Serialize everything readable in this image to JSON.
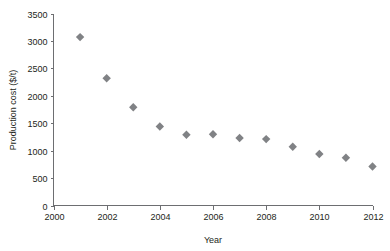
{
  "chart_data": {
    "type": "scatter",
    "title": "",
    "xlabel": "Year",
    "ylabel": "Production cost ($/t)",
    "xlim": [
      2000,
      2012
    ],
    "ylim": [
      0,
      3500
    ],
    "xticks": [
      2000,
      2002,
      2004,
      2006,
      2008,
      2010,
      2012
    ],
    "xticklabels": [
      "2000",
      "2002",
      "2004",
      "2006",
      "2008",
      "2010",
      "2012"
    ],
    "yticks": [
      0,
      500,
      1000,
      1500,
      2000,
      2500,
      3000,
      3500
    ],
    "yticklabels": [
      "0",
      "500",
      "1000",
      "1500",
      "2000",
      "2500",
      "3000",
      "3500"
    ],
    "grid": false,
    "legend": false,
    "marker": "diamond",
    "marker_color": "#808285",
    "x": [
      2001,
      2002,
      2003,
      2004,
      2005,
      2006,
      2007,
      2008,
      2009,
      2010,
      2011,
      2012
    ],
    "values": [
      3070,
      2320,
      1790,
      1440,
      1290,
      1300,
      1230,
      1210,
      1070,
      940,
      870,
      710
    ],
    "points": [
      {
        "x": 2001,
        "y": 3070
      },
      {
        "x": 2002,
        "y": 2320
      },
      {
        "x": 2003,
        "y": 1790
      },
      {
        "x": 2004,
        "y": 1440
      },
      {
        "x": 2005,
        "y": 1290
      },
      {
        "x": 2006,
        "y": 1300
      },
      {
        "x": 2007,
        "y": 1230
      },
      {
        "x": 2008,
        "y": 1210
      },
      {
        "x": 2009,
        "y": 1070
      },
      {
        "x": 2010,
        "y": 940
      },
      {
        "x": 2011,
        "y": 870
      },
      {
        "x": 2012,
        "y": 710
      }
    ]
  },
  "axis": {
    "line_color": "#6d6e71"
  }
}
